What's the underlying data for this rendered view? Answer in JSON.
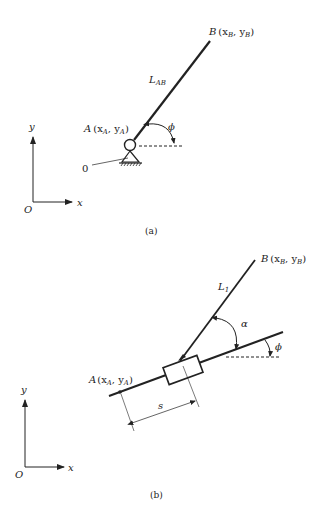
{
  "figure_a": {
    "caption": "(a)",
    "point_B": {
      "name": "B",
      "coords": "(x",
      "sub1": "B",
      "mid": ", y",
      "sub2": "B",
      "close": ")"
    },
    "point_A": {
      "name": "A",
      "coords": "(x",
      "sub1": "A",
      "mid": ", y",
      "sub2": "A",
      "close": ")"
    },
    "link_label": {
      "main": "L",
      "sub": "AB"
    },
    "angle_label": "ϕ",
    "ground_label": "0",
    "axes": {
      "y": "y",
      "x": "x",
      "origin": "O"
    }
  },
  "figure_b": {
    "caption": "(b)",
    "point_B": {
      "name": "B",
      "coords": "(x",
      "sub1": "B",
      "mid": ", y",
      "sub2": "B",
      "close": ")"
    },
    "point_A": {
      "name": "A",
      "coords": "(x",
      "sub1": "A",
      "mid": ", y",
      "sub2": "A",
      "close": ")"
    },
    "link_label": {
      "main": "L",
      "sub": "1"
    },
    "angle_alpha": "α",
    "angle_phi": "ϕ",
    "distance_label": "s",
    "axes": {
      "y": "y",
      "x": "x",
      "origin": "O"
    }
  }
}
